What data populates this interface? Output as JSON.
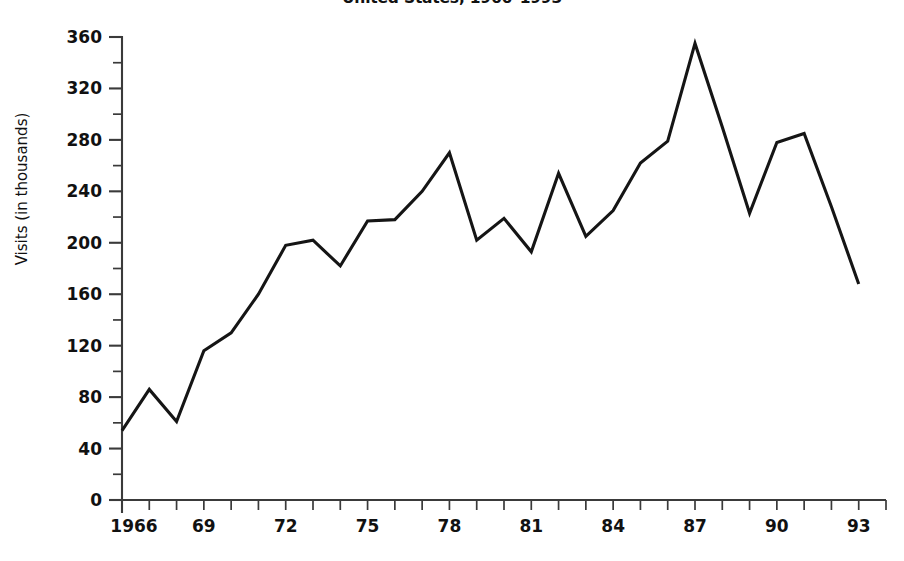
{
  "chart_data": {
    "type": "line",
    "title": "United States, 1966–1993",
    "xlabel": "",
    "ylabel": "Visits (in thousands)",
    "x": [
      1966,
      1967,
      1968,
      1969,
      1970,
      1971,
      1972,
      1973,
      1974,
      1975,
      1976,
      1977,
      1978,
      1979,
      1980,
      1981,
      1982,
      1983,
      1984,
      1985,
      1986,
      1987,
      1988,
      1989,
      1990,
      1991,
      1992,
      1993
    ],
    "values": [
      54,
      86,
      61,
      116,
      130,
      160,
      198,
      202,
      182,
      217,
      218,
      240,
      270,
      202,
      219,
      193,
      254,
      205,
      225,
      262,
      279,
      355,
      290,
      223,
      278,
      285,
      228,
      168
    ],
    "series": [
      {
        "name": "Visits",
        "values": [
          54,
          86,
          61,
          116,
          130,
          160,
          198,
          202,
          182,
          217,
          218,
          240,
          270,
          202,
          219,
          193,
          254,
          205,
          225,
          262,
          279,
          355,
          290,
          223,
          278,
          285,
          228,
          168
        ]
      }
    ],
    "xlim": [
      1966,
      1994
    ],
    "ylim": [
      0,
      380
    ],
    "x_tick_labels": [
      "1966",
      "69",
      "72",
      "75",
      "78",
      "81",
      "84",
      "87",
      "90",
      "93"
    ],
    "x_tick_label_years": [
      1966,
      1969,
      1972,
      1975,
      1978,
      1981,
      1984,
      1987,
      1990,
      1993
    ],
    "x_minor_tick_years": [
      1966,
      1967,
      1968,
      1969,
      1970,
      1971,
      1972,
      1973,
      1974,
      1975,
      1976,
      1977,
      1978,
      1979,
      1980,
      1981,
      1982,
      1983,
      1984,
      1985,
      1986,
      1987,
      1988,
      1989,
      1990,
      1991,
      1992,
      1993
    ],
    "y_tick_labels": [
      "0",
      "40",
      "80",
      "120",
      "160",
      "200",
      "240",
      "280",
      "320",
      "360"
    ],
    "y_tick_values": [
      0,
      40,
      80,
      120,
      160,
      200,
      240,
      280,
      320,
      360
    ],
    "y_minor_tick_values": [
      20,
      60,
      100,
      140,
      180,
      220,
      260,
      300,
      340
    ],
    "grid": false,
    "legend": false,
    "line_color": "#151515",
    "axis_color": "#3a3a3a",
    "background_color": "#ffffff"
  }
}
